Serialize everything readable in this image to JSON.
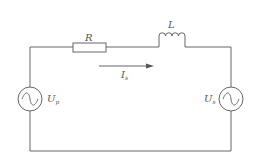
{
  "diagram": {
    "type": "circuit",
    "components": {
      "resistor": {
        "symbol": "R"
      },
      "inductor": {
        "symbol": "L"
      },
      "current": {
        "symbol": "I",
        "subscript": "s"
      },
      "source_left": {
        "symbol": "U",
        "subscript": "p"
      },
      "source_right": {
        "symbol": "U",
        "subscript": "s"
      }
    }
  },
  "colors": {
    "line": "#555555",
    "background": "#ffffff"
  }
}
